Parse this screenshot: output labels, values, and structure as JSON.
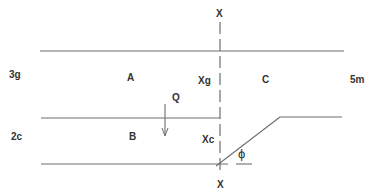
{
  "diagram": {
    "axis_labels": {
      "top": "X",
      "bottom": "X"
    },
    "left_labels": {
      "upper": "3g",
      "lower": "2c"
    },
    "right_label": "5m",
    "region_labels": {
      "a": "A",
      "b": "B",
      "c": "C"
    },
    "axis_region_labels": {
      "xg": "Xg",
      "xc": "Xc"
    },
    "force_label": "Q",
    "angle_label": "ϕ",
    "colors": {
      "line": "#6e6e6e",
      "text": "#333333",
      "background": "#ffffff"
    }
  }
}
